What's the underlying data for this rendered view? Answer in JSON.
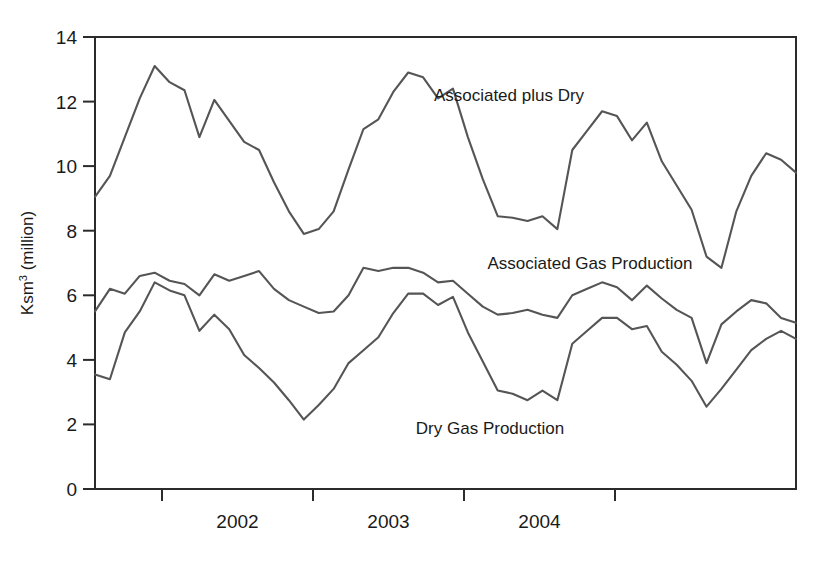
{
  "chart_data": {
    "type": "line",
    "title": "",
    "xlabel": "",
    "ylabel": "Ksm³ (million)",
    "ylabel_base": "Ksm",
    "ylabel_sup": "3",
    "ylabel_tail": " (million)",
    "ylim": [
      0,
      14
    ],
    "ytick_values": [
      0,
      2,
      4,
      6,
      8,
      10,
      12,
      14
    ],
    "ytick_labels": [
      "0",
      "2",
      "4",
      "6",
      "8",
      "10",
      "12",
      "14"
    ],
    "xtick_labels": [
      "2002",
      "2003",
      "2004"
    ],
    "xtick_positions_year_start": [
      2002,
      2003,
      2004,
      2005
    ],
    "x_start": 2001.33,
    "x_end": 2004.67,
    "grid": false,
    "legend_position": "inline-annotations",
    "series": [
      {
        "name": "Associated plus Dry",
        "label": "Associated plus Dry",
        "color": "#555555",
        "values": [
          9.05,
          9.7,
          10.9,
          12.1,
          13.1,
          12.6,
          12.35,
          10.9,
          12.05,
          11.4,
          10.75,
          10.5,
          9.5,
          8.6,
          7.9,
          8.05,
          8.6,
          9.9,
          11.15,
          11.45,
          12.3,
          12.9,
          12.75,
          12.1,
          12.4,
          10.9,
          9.6,
          8.45,
          8.4,
          8.3,
          8.45,
          8.05,
          10.5,
          11.1,
          11.7,
          11.55,
          10.8,
          11.35,
          10.15,
          9.4,
          8.65,
          7.2,
          6.85,
          8.6,
          9.7,
          10.4,
          10.2,
          9.8
        ]
      },
      {
        "name": "Associated Gas Production",
        "label": "Associated Gas Production",
        "color": "#555555",
        "values": [
          5.5,
          6.2,
          6.05,
          6.6,
          6.7,
          6.45,
          6.35,
          6.0,
          6.65,
          6.45,
          6.6,
          6.75,
          6.2,
          5.85,
          5.65,
          5.45,
          5.5,
          6.0,
          6.85,
          6.75,
          6.85,
          6.85,
          6.7,
          6.4,
          6.45,
          6.05,
          5.65,
          5.4,
          5.45,
          5.55,
          5.4,
          5.3,
          6.0,
          6.2,
          6.4,
          6.25,
          5.85,
          6.3,
          5.9,
          5.55,
          5.3,
          3.9,
          5.1,
          5.5,
          5.85,
          5.75,
          5.3,
          5.15
        ]
      },
      {
        "name": "Dry Gas Production",
        "label": "Dry Gas Production",
        "color": "#555555",
        "values": [
          3.55,
          3.4,
          4.85,
          5.5,
          6.4,
          6.15,
          6.0,
          4.9,
          5.4,
          4.95,
          4.15,
          3.75,
          3.3,
          2.75,
          2.15,
          2.6,
          3.1,
          3.9,
          4.3,
          4.7,
          5.45,
          6.05,
          6.05,
          5.7,
          5.95,
          4.85,
          3.95,
          3.05,
          2.95,
          2.75,
          3.05,
          2.75,
          4.5,
          4.9,
          5.3,
          5.3,
          4.95,
          5.05,
          4.25,
          3.85,
          3.35,
          2.55,
          3.1,
          3.7,
          4.3,
          4.65,
          4.9,
          4.65
        ]
      }
    ],
    "annotations": [
      {
        "text": "Associated plus Dry",
        "x_px": 509,
        "y_px": 101
      },
      {
        "text": "Associated Gas Production",
        "x_px": 455,
        "y_px": 269
      },
      {
        "text": "Dry Gas Production",
        "x_px": 413,
        "y_px": 434
      }
    ]
  },
  "axis": {
    "y_title": "Ksm³ (million)",
    "tick_0": "0",
    "tick_2": "2",
    "tick_4": "4",
    "tick_6": "6",
    "tick_8": "8",
    "tick_10": "10",
    "tick_12": "12",
    "tick_14": "14",
    "x_2002": "2002",
    "x_2003": "2003",
    "x_2004": "2004"
  }
}
